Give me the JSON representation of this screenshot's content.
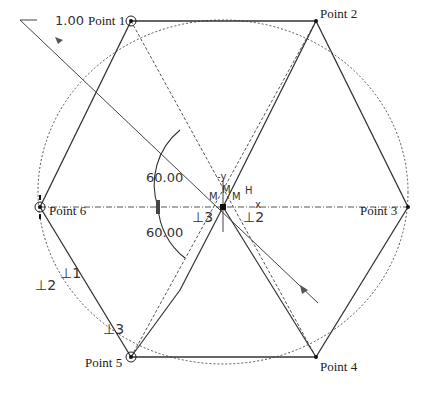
{
  "diagram": {
    "scale_label": "1.00",
    "points": [
      {
        "label": "Point 1",
        "x": 131,
        "y": 21
      },
      {
        "label": "Point 2",
        "x": 316,
        "y": 21
      },
      {
        "label": "Point 3",
        "x": 408,
        "y": 207
      },
      {
        "label": "Point 4",
        "x": 316,
        "y": 357
      },
      {
        "label": "Point 5",
        "x": 131,
        "y": 357
      },
      {
        "label": "Point 6",
        "x": 40,
        "y": 207
      }
    ],
    "angles": {
      "upper": "60.00",
      "lower": "60.00"
    },
    "constraints": {
      "perp1": "⊥1",
      "perp2_left": "⊥2",
      "perp3_left": "⊥3",
      "perp3_center": "⊥3",
      "perp2_center": "⊥2"
    },
    "center_marks": {
      "neg_y": "-y",
      "m1": "M",
      "m2": "M",
      "m3": "M",
      "h": "H",
      "x": "x"
    }
  }
}
